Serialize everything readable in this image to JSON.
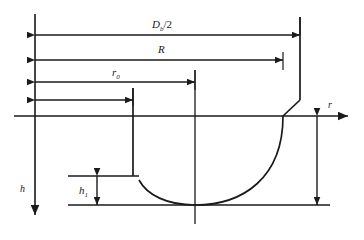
{
  "figure": {
    "type": "engineering-cross-section",
    "background_color": "#ffffff",
    "line_color": "#1a1a1a"
  },
  "axes": {
    "horizontal": {
      "name": "r-axis",
      "label": "r",
      "direction": "right",
      "arrow": true
    },
    "vertical": {
      "name": "h-axis",
      "label": "h",
      "direction": "down",
      "arrow": true
    }
  },
  "dimensions": [
    {
      "id": "db-half",
      "label_base": "D",
      "label_sub": "b",
      "label_tail": "/2",
      "label_full": "Db/2",
      "orientation": "horizontal",
      "arrowheads": "both",
      "row": 1
    },
    {
      "id": "radius-R",
      "label_base": "R",
      "label_sub": "",
      "label_tail": "",
      "label_full": "R",
      "orientation": "horizontal",
      "arrowheads": "both",
      "row": 2
    },
    {
      "id": "radius-r0",
      "label_base": "r",
      "label_sub": "0",
      "label_tail": "",
      "label_full": "r0",
      "orientation": "horizontal",
      "arrowheads": "both",
      "row": 3
    },
    {
      "id": "inner-span",
      "label_base": "",
      "label_sub": "",
      "label_tail": "",
      "label_full": "",
      "orientation": "horizontal",
      "arrowheads": "both",
      "row": 4
    },
    {
      "id": "height-h1",
      "label_base": "h",
      "label_sub": "1",
      "label_tail": "",
      "label_full": "h1",
      "orientation": "vertical",
      "arrowheads": "both",
      "row": 5
    },
    {
      "id": "total-depth",
      "label_base": "",
      "label_sub": "",
      "label_tail": "",
      "label_full": "",
      "orientation": "vertical",
      "arrowheads": "both",
      "row": 6
    }
  ]
}
